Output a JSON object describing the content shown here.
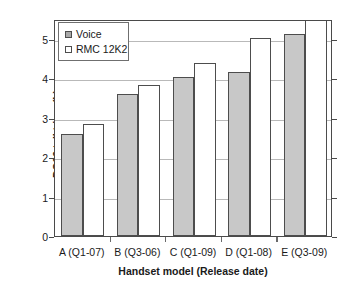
{
  "chart_data": {
    "type": "bar",
    "title": "",
    "xlabel": "Handset model (Release date)",
    "ylabel": "DG09 talkt-ime (h)",
    "categories": [
      "A (Q1-07)",
      "B (Q3-06)",
      "C (Q1-09)",
      "D (Q1-08)",
      "E (Q3-09)"
    ],
    "series": [
      {
        "name": "Voice",
        "values": [
          2.58,
          3.6,
          4.02,
          4.16,
          5.12
        ],
        "color": "#c8c8c8"
      },
      {
        "name": "RMC 12K2",
        "values": [
          2.84,
          3.84,
          4.39,
          5.01,
          5.47
        ],
        "color": "#ffffff"
      }
    ],
    "ylim": [
      0,
      5.5
    ],
    "yticks": [
      0,
      1,
      2,
      3,
      4,
      5
    ],
    "ytick_labels": [
      "0",
      "1",
      "2",
      "3",
      "4",
      "5"
    ],
    "grid": true,
    "grid_axis": "y",
    "legend_position": "upper-left"
  },
  "legend": {
    "items": [
      {
        "label": "Voice",
        "swatch": "voice-swatch"
      },
      {
        "label": "RMC 12K2",
        "swatch": "rmc-swatch"
      }
    ]
  }
}
